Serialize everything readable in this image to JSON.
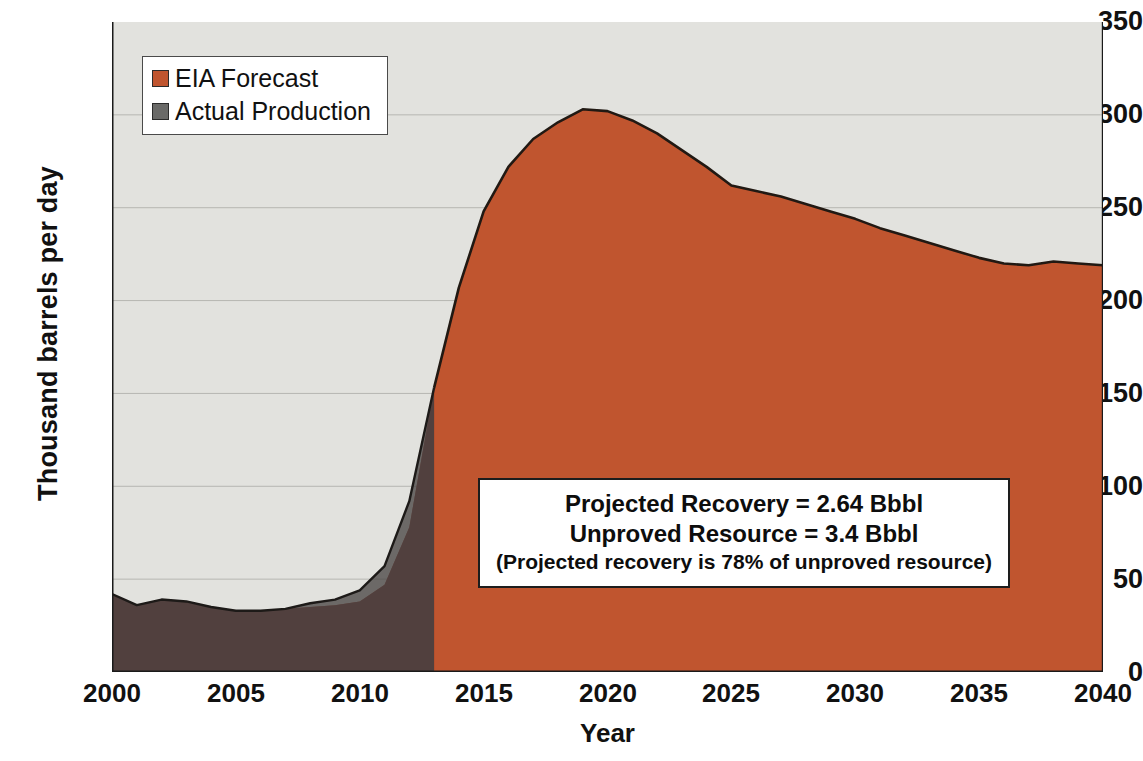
{
  "chart_data": {
    "type": "area",
    "title": "",
    "xlabel": "Year",
    "ylabel": "Thousand barrels per day",
    "xlim": [
      2000,
      2040
    ],
    "ylim": [
      0,
      350
    ],
    "xticks": [
      "2000",
      "2005",
      "2010",
      "2015",
      "2020",
      "2025",
      "2030",
      "2035",
      "2040"
    ],
    "yticks": [
      "0",
      "50",
      "100",
      "150",
      "200",
      "250",
      "300",
      "350"
    ],
    "grid": true,
    "legend_position": "top-left",
    "x": [
      2000,
      2001,
      2002,
      2003,
      2004,
      2005,
      2006,
      2007,
      2008,
      2009,
      2010,
      2011,
      2012,
      2013,
      2014,
      2015,
      2016,
      2017,
      2018,
      2019,
      2020,
      2021,
      2022,
      2023,
      2024,
      2025,
      2026,
      2027,
      2028,
      2029,
      2030,
      2031,
      2032,
      2033,
      2034,
      2035,
      2036,
      2037,
      2038,
      2039,
      2040
    ],
    "series": [
      {
        "name": "EIA Forecast",
        "color": "#c0552f",
        "values": [
          42,
          36,
          39,
          38,
          35,
          33,
          33,
          34,
          35,
          36,
          38,
          47,
          78,
          153,
          207,
          248,
          272,
          287,
          296,
          303,
          302,
          297,
          290,
          281,
          272,
          262,
          259,
          256,
          252,
          248,
          244,
          239,
          235,
          231,
          227,
          223,
          220,
          219,
          221,
          220,
          219
        ]
      },
      {
        "name": "Actual Production",
        "color": "#6a6a68",
        "values": [
          42,
          36,
          39,
          38,
          35,
          33,
          33,
          34,
          37,
          39,
          44,
          57,
          92,
          153,
          null,
          null,
          null,
          null,
          null,
          null,
          null,
          null,
          null,
          null,
          null,
          null,
          null,
          null,
          null,
          null,
          null,
          null,
          null,
          null,
          null,
          null,
          null,
          null,
          null,
          null,
          null
        ]
      }
    ],
    "annotations": [
      "Projected Recovery = 2.64 Bbbl",
      "Unproved Resource = 3.4 Bbbl",
      "(Projected recovery is 78% of unproved resource)"
    ],
    "history_forecast_split_year": 2013
  },
  "legend": {
    "items": [
      {
        "label": "EIA Forecast",
        "color": "#c0552f"
      },
      {
        "label": "Actual Production",
        "color": "#6a6a68"
      }
    ]
  },
  "axes": {
    "ylabel": "Thousand barrels per day",
    "xlabel": "Year",
    "yticks": [
      "350",
      "300",
      "250",
      "200",
      "150",
      "100",
      "50",
      "0"
    ],
    "xticks": [
      "2000",
      "2005",
      "2010",
      "2015",
      "2020",
      "2025",
      "2030",
      "2035",
      "2040"
    ]
  },
  "annotation_box": {
    "line1": "Projected Recovery = 2.64 Bbbl",
    "line2": "Unproved Resource = 3.4 Bbbl",
    "line3": "(Projected recovery is 78% of unproved resource)"
  },
  "colors": {
    "forecast_fill": "#c0552f",
    "history_fill": "#6b2b28",
    "actual_fill": "#4a4745",
    "plot_background": "#e2e2de",
    "gridline": "#b6b6b2",
    "axis": "#1a1a1a"
  }
}
